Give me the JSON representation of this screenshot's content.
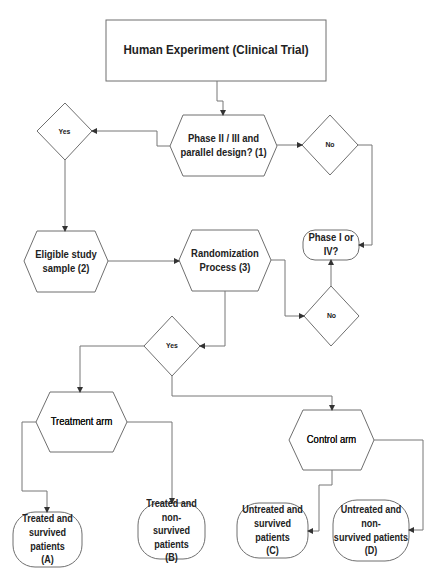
{
  "diagram": {
    "title": "Human Experiment (Clinical Trial)",
    "nodes": {
      "phase_question": "Phase II /  III and\nparallel design? (1)",
      "yes_top": "Yes",
      "no_top": "No",
      "eligible": "Eligible study\nsample (2)",
      "randomization": "Randomization\nProcess (3)",
      "phase_i_iv": "Phase I or IV?",
      "no_bottom": "No",
      "yes_bottom": "Yes",
      "treatment_arm": "Treatment  arm",
      "control_arm": "Control arm",
      "outcome_a": "Treated and\nsurvived patients\n(A)",
      "outcome_b": "Treated and non-\nsurvived patients\n(B)",
      "outcome_c": "Untreated and\nsurvived patients\n(C)",
      "outcome_d": "Untreated and non-\nsurvived patients\n(D)"
    },
    "edges": [
      {
        "from": "title",
        "to": "phase_question"
      },
      {
        "from": "phase_question",
        "to": "yes_top"
      },
      {
        "from": "phase_question",
        "to": "no_top"
      },
      {
        "from": "yes_top",
        "to": "eligible"
      },
      {
        "from": "no_top",
        "to": "phase_i_iv"
      },
      {
        "from": "eligible",
        "to": "randomization"
      },
      {
        "from": "randomization",
        "to": "no_bottom"
      },
      {
        "from": "no_bottom",
        "to": "phase_i_iv"
      },
      {
        "from": "randomization",
        "to": "yes_bottom"
      },
      {
        "from": "yes_bottom",
        "to": "treatment_arm"
      },
      {
        "from": "yes_bottom",
        "to": "control_arm"
      },
      {
        "from": "treatment_arm",
        "to": "outcome_a"
      },
      {
        "from": "treatment_arm",
        "to": "outcome_b"
      },
      {
        "from": "control_arm",
        "to": "outcome_c"
      },
      {
        "from": "control_arm",
        "to": "outcome_d"
      }
    ],
    "colors": {
      "stroke": "#6f6f6f",
      "text": "#222222",
      "background": "#ffffff"
    }
  }
}
